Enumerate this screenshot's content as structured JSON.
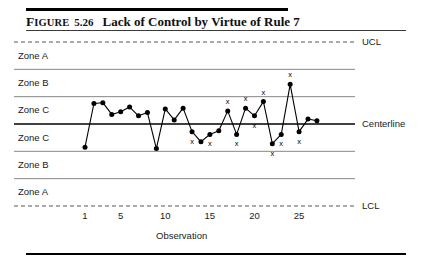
{
  "figure": {
    "label_prefix": "FIGURE",
    "number": "5.26",
    "title": "Lack of Control by Virtue of Rule 7"
  },
  "chart_data": {
    "type": "line",
    "title": "Lack of Control by Virtue of Rule 7",
    "xlabel": "Observation",
    "ylabel": "",
    "xlim": [
      0,
      28
    ],
    "ylim": [
      0,
      6
    ],
    "grid": false,
    "legend_position": "right-labels",
    "x_ticks": [
      1,
      5,
      10,
      15,
      20,
      25
    ],
    "x_tick_labels": [
      "1",
      "5",
      "10",
      "15",
      "20",
      "25"
    ],
    "zone_bands_top_to_bottom": [
      "Zone A",
      "Zone B",
      "Zone C",
      "Zone C",
      "Zone B",
      "Zone A"
    ],
    "control_limits": [
      {
        "name": "UCL",
        "label": "UCL",
        "value": 6,
        "style": "dashed"
      },
      {
        "name": "upper_zone_A_B",
        "label": "",
        "value": 5,
        "style": "solid"
      },
      {
        "name": "upper_zone_B_C",
        "label": "",
        "value": 4,
        "style": "solid"
      },
      {
        "name": "Centerline",
        "label": "Centerline",
        "value": 3,
        "style": "solid-bold"
      },
      {
        "name": "lower_zone_C_B",
        "label": "",
        "value": 2,
        "style": "solid"
      },
      {
        "name": "lower_zone_B_A",
        "label": "",
        "value": 1,
        "style": "solid"
      },
      {
        "name": "LCL",
        "label": "LCL",
        "value": 0,
        "style": "dashed"
      }
    ],
    "series": [
      {
        "name": "Observation value",
        "marker": "filled-circle",
        "x": [
          1,
          2,
          3,
          4,
          5,
          6,
          7,
          8,
          9,
          10,
          11,
          12,
          13,
          14,
          15,
          16,
          17,
          18,
          19,
          20,
          21,
          22,
          23,
          24,
          25,
          26,
          27
        ],
        "values": [
          2.15,
          3.75,
          3.78,
          3.35,
          3.45,
          3.62,
          3.3,
          3.42,
          2.1,
          3.55,
          3.15,
          3.58,
          2.72,
          2.35,
          2.62,
          2.75,
          3.48,
          2.62,
          3.58,
          3.3,
          3.82,
          2.28,
          2.62,
          4.45,
          2.72,
          3.18,
          3.12
        ]
      }
    ],
    "rule7_markers": {
      "label": "x",
      "description": "Points flagged by Rule 7 (alternating above/below centerline run)",
      "points": [
        {
          "x": 13,
          "position": "below"
        },
        {
          "x": 15,
          "position": "below"
        },
        {
          "x": 17,
          "position": "above"
        },
        {
          "x": 18,
          "position": "below"
        },
        {
          "x": 19,
          "position": "above"
        },
        {
          "x": 20,
          "position": "below"
        },
        {
          "x": 21,
          "position": "above"
        },
        {
          "x": 22,
          "position": "below"
        },
        {
          "x": 23,
          "position": "below"
        },
        {
          "x": 24,
          "position": "above"
        },
        {
          "x": 25,
          "position": "below"
        }
      ]
    }
  }
}
